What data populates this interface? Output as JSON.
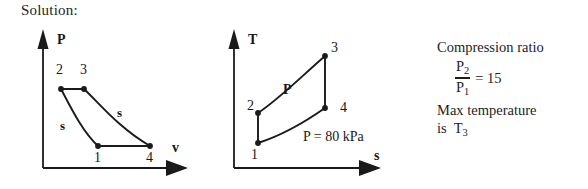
{
  "heading": "Solution:",
  "pv_diagram": {
    "name": "pressure-volume-diagram",
    "y_axis_label": "P",
    "x_axis_label": "v",
    "state_labels": [
      "2",
      "3",
      "1",
      "4"
    ],
    "process_labels": [
      "s",
      "s"
    ],
    "states": [
      {
        "id": "2",
        "x": 61,
        "y": 89
      },
      {
        "id": "3",
        "x": 84,
        "y": 89
      },
      {
        "id": "1",
        "x": 98,
        "y": 146
      },
      {
        "id": "4",
        "x": 150,
        "y": 146
      }
    ]
  },
  "ts_diagram": {
    "name": "temperature-entropy-diagram",
    "y_axis_label": "T",
    "x_axis_label": "s",
    "state_labels": [
      "3",
      "4",
      "2",
      "1"
    ],
    "isobar_label": "P",
    "pressure_annotation": "P = 80 kPa",
    "states": [
      {
        "id": "3",
        "x": 325,
        "y": 56
      },
      {
        "id": "4",
        "x": 325,
        "y": 108
      },
      {
        "id": "2",
        "x": 258,
        "y": 113
      },
      {
        "id": "1",
        "x": 258,
        "y": 143
      }
    ]
  },
  "notes": {
    "compression_ratio_label": "Compression ratio",
    "ratio_numerator": "P",
    "ratio_numerator_sub": "2",
    "ratio_denominator": "P",
    "ratio_denominator_sub": "1",
    "ratio_equals": "= 15",
    "ratio_value": "15",
    "max_temperature_line1": "Max temperature",
    "max_temperature_line2": "is",
    "max_temperature_symbol": "T",
    "max_temperature_sub": "3"
  },
  "colors": {
    "ink": "#1a1a1a",
    "background": "#ffffff"
  }
}
